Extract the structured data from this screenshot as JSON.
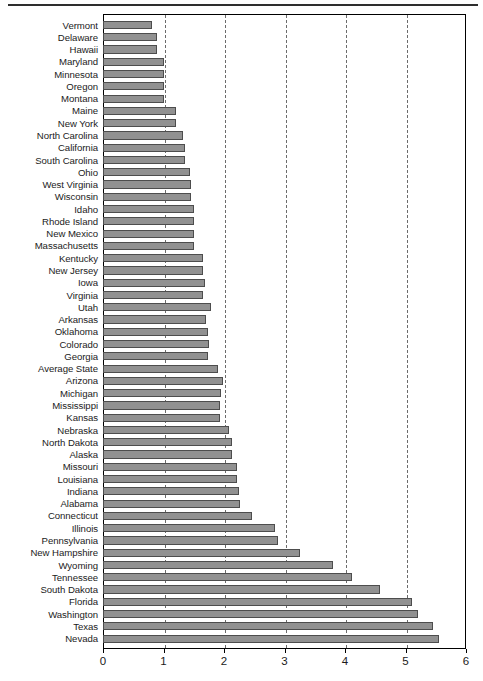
{
  "figure": {
    "title": "",
    "top_rule_color": "#2e2e2e",
    "bar_fill": "#919191",
    "bar_edge": "#4d4d4d",
    "grid_color": "#6b6b6b",
    "frame_color": "#000000"
  },
  "chart_data": {
    "type": "bar",
    "orientation": "horizontal",
    "title": "",
    "xlabel": "",
    "ylabel": "",
    "xlim": [
      0,
      6
    ],
    "ylim": null,
    "grid": true,
    "grid_axis": "x",
    "grid_style": "dashed",
    "legend": null,
    "xticks": [
      0,
      1,
      2,
      3,
      4,
      5,
      6
    ],
    "xtick_labels": [
      "0",
      "1",
      "2",
      "3",
      "4",
      "5",
      "6"
    ],
    "categories": [
      "Vermont",
      "Delaware",
      "Hawaii",
      "Maryland",
      "Minnesota",
      "Oregon",
      "Montana",
      "Maine",
      "New York",
      "North Carolina",
      "California",
      "South Carolina",
      "Ohio",
      "West Virginia",
      "Wisconsin",
      "Idaho",
      "Rhode Island",
      "New Mexico",
      "Massachusetts",
      "Kentucky",
      "New Jersey",
      "Iowa",
      "Virginia",
      "Utah",
      "Arkansas",
      "Oklahoma",
      "Colorado",
      "Georgia",
      "Average State",
      "Arizona",
      "Michigan",
      "Mississippi",
      "Kansas",
      "Nebraska",
      "North Dakota",
      "Alaska",
      "Missouri",
      "Louisiana",
      "Indiana",
      "Alabama",
      "Connecticut",
      "Illinois",
      "Pennsylvania",
      "New Hampshire",
      "Wyoming",
      "Tennessee",
      "South Dakota",
      "Florida",
      "Washington",
      "Texas",
      "Nevada"
    ],
    "values": [
      0.81,
      0.89,
      0.89,
      1.0,
      1.0,
      1.0,
      1.0,
      1.21,
      1.21,
      1.33,
      1.35,
      1.35,
      1.43,
      1.45,
      1.46,
      1.5,
      1.51,
      1.5,
      1.5,
      1.65,
      1.66,
      1.68,
      1.66,
      1.78,
      1.71,
      1.73,
      1.75,
      1.74,
      1.9,
      1.98,
      1.95,
      1.93,
      1.93,
      2.08,
      2.13,
      2.13,
      2.21,
      2.22,
      2.25,
      2.27,
      2.46,
      2.85,
      2.9,
      3.25,
      3.8,
      4.12,
      4.58,
      5.1,
      5.2,
      5.45,
      5.55
    ]
  }
}
